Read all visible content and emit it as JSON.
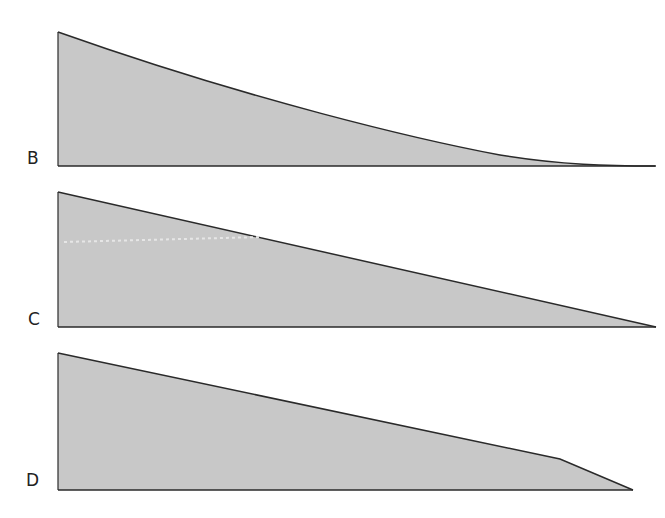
{
  "colors": {
    "fill": "#c8c8c8",
    "stroke": "#2a2a2a",
    "label": "#222222",
    "background": "#ffffff"
  },
  "panels": [
    {
      "label": "B",
      "shape": "concave-decay",
      "description": "Curve decaying from a high left edge toward zero at the right"
    },
    {
      "label": "C",
      "shape": "linear-decay",
      "description": "Straight line decreasing linearly from left edge to zero at the right"
    },
    {
      "label": "D",
      "shape": "linear-then-steep-drop",
      "description": "Gentle linear decline followed by a steeper drop to zero near the right"
    }
  ]
}
